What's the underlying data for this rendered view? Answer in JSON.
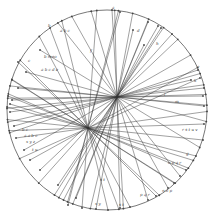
{
  "diagram": {
    "type": "circle-chord-diagram",
    "circle": {
      "cx": 107,
      "cy": 110,
      "r": 100
    },
    "colors": {
      "background": "#ffffff",
      "ink": "#333333"
    },
    "foci": [
      {
        "name": "upper-focus",
        "x": 117,
        "y": 97
      },
      {
        "name": "lower-focus",
        "x": 88,
        "y": 128
      }
    ],
    "chords_upper": [
      [
        112,
        10
      ],
      [
        148,
        22
      ],
      [
        158,
        26
      ],
      [
        161,
        28
      ],
      [
        133,
        30
      ],
      [
        144,
        45
      ],
      [
        198,
        70
      ],
      [
        191,
        80
      ],
      [
        204,
        88
      ],
      [
        203,
        96
      ],
      [
        204,
        106
      ],
      [
        40,
        50
      ],
      [
        26,
        72
      ],
      [
        18,
        88
      ],
      [
        12,
        100
      ],
      [
        10,
        112
      ],
      [
        14,
        126
      ],
      [
        24,
        150
      ],
      [
        40,
        170
      ],
      [
        58,
        185
      ],
      [
        76,
        198
      ],
      [
        96,
        209
      ],
      [
        120,
        208
      ],
      [
        148,
        200
      ],
      [
        168,
        188
      ],
      [
        180,
        176
      ]
    ],
    "chords_lower": [
      [
        50,
        28
      ],
      [
        18,
        62
      ],
      [
        12,
        80
      ],
      [
        8,
        96
      ],
      [
        10,
        104
      ],
      [
        16,
        138
      ],
      [
        30,
        160
      ],
      [
        68,
        205
      ],
      [
        82,
        208
      ],
      [
        108,
        210
      ],
      [
        130,
        207
      ],
      [
        156,
        196
      ],
      [
        174,
        183
      ],
      [
        186,
        170
      ],
      [
        196,
        156
      ],
      [
        203,
        140
      ],
      [
        204,
        124
      ],
      [
        200,
        78
      ],
      [
        172,
        34
      ],
      [
        120,
        12
      ]
    ],
    "labels": [
      {
        "text": "a",
        "x": 112,
        "y": 9
      },
      {
        "text": "b",
        "x": 48,
        "y": 27
      },
      {
        "text": "a b c",
        "x": 60,
        "y": 32
      },
      {
        "text": "f",
        "x": 90,
        "y": 52
      },
      {
        "text": "b mno",
        "x": 44,
        "y": 58
      },
      {
        "text": "a b c d e",
        "x": 41,
        "y": 71
      },
      {
        "text": "c",
        "x": 28,
        "y": 62
      },
      {
        "text": "d",
        "x": 137,
        "y": 32
      },
      {
        "text": "h",
        "x": 156,
        "y": 45
      },
      {
        "text": "e",
        "x": 197,
        "y": 68
      },
      {
        "text": "k",
        "x": 194,
        "y": 82
      },
      {
        "text": "l",
        "x": 164,
        "y": 96
      },
      {
        "text": "m",
        "x": 175,
        "y": 103
      },
      {
        "text": "r s t u v",
        "x": 182,
        "y": 131
      },
      {
        "text": "g",
        "x": 186,
        "y": 155
      },
      {
        "text": "o p q r",
        "x": 168,
        "y": 164
      },
      {
        "text": "n o p",
        "x": 162,
        "y": 192
      },
      {
        "text": "p q r",
        "x": 140,
        "y": 196
      },
      {
        "text": "b c",
        "x": 22,
        "y": 131
      },
      {
        "text": "a a b c",
        "x": 24,
        "y": 137
      },
      {
        "text": "x y z",
        "x": 26,
        "y": 143
      },
      {
        "text": "t u",
        "x": 32,
        "y": 151
      },
      {
        "text": "s t",
        "x": 100,
        "y": 181
      },
      {
        "text": "x y",
        "x": 95,
        "y": 205
      },
      {
        "text": "s t",
        "x": 119,
        "y": 206
      }
    ]
  }
}
